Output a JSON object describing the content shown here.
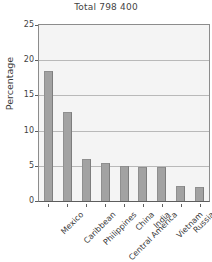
{
  "chart_data": {
    "type": "bar",
    "title": "Total 798 400",
    "xlabel": "",
    "ylabel": "Percentage",
    "ylim": [
      0,
      25
    ],
    "yticks": [
      0,
      5,
      10,
      15,
      20,
      25
    ],
    "ytick_labels": [
      "0",
      "5",
      "10",
      "15",
      "20",
      "25"
    ],
    "grid": true,
    "legend": false,
    "bar_color": "#a2a2a2",
    "plot_background": "#f4f4f4",
    "categories": [
      "Mexico",
      "Caribbean",
      "Philippines",
      "Central America",
      "China",
      "India",
      "Vietnam",
      "Russia",
      "Ukraine"
    ],
    "values": [
      18.5,
      12.6,
      6.0,
      5.4,
      5.0,
      4.8,
      4.8,
      2.2,
      2.0
    ]
  }
}
